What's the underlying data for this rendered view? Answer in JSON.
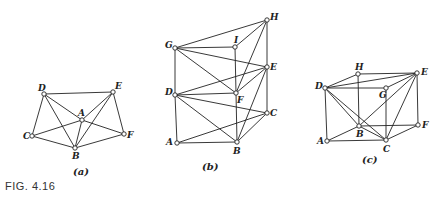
{
  "figure_label": "FIG. 4.16",
  "graphs": [
    {
      "caption": "(a)",
      "caption_pos": [
        73,
        175
      ],
      "nodes": {
        "D": {
          "x": 44,
          "y": 94,
          "lx": -6,
          "ly": -3
        },
        "E": {
          "x": 113,
          "y": 92,
          "lx": 2,
          "ly": -3
        },
        "A": {
          "x": 82,
          "y": 120,
          "lx": -4,
          "ly": -4
        },
        "C": {
          "x": 32,
          "y": 136,
          "lx": -9,
          "ly": 3
        },
        "F": {
          "x": 124,
          "y": 134,
          "lx": 3,
          "ly": 4
        },
        "B": {
          "x": 75,
          "y": 148,
          "lx": -3,
          "ly": 11
        }
      },
      "edges": [
        [
          "D",
          "E"
        ],
        [
          "D",
          "C"
        ],
        [
          "D",
          "A"
        ],
        [
          "A",
          "F"
        ],
        [
          "D",
          "B"
        ],
        [
          "E",
          "A"
        ],
        [
          "C",
          "A"
        ],
        [
          "E",
          "B"
        ],
        [
          "E",
          "F"
        ],
        [
          "A",
          "B"
        ],
        [
          "C",
          "B"
        ],
        [
          "B",
          "F"
        ]
      ]
    },
    {
      "caption": "(b)",
      "caption_pos": [
        202,
        170
      ],
      "nodes": {
        "H": {
          "x": 267,
          "y": 20,
          "lx": 3,
          "ly": 0
        },
        "I": {
          "x": 235,
          "y": 47,
          "lx": -1,
          "ly": -4
        },
        "G": {
          "x": 175,
          "y": 48,
          "lx": -10,
          "ly": 0
        },
        "E": {
          "x": 267,
          "y": 67,
          "lx": 3,
          "ly": 3
        },
        "D": {
          "x": 175,
          "y": 95,
          "lx": -10,
          "ly": 0
        },
        "F": {
          "x": 236,
          "y": 93,
          "lx": 1,
          "ly": 10
        },
        "C": {
          "x": 267,
          "y": 113,
          "lx": 3,
          "ly": 3
        },
        "A": {
          "x": 177,
          "y": 143,
          "lx": -11,
          "ly": 2
        },
        "B": {
          "x": 237,
          "y": 142,
          "lx": -4,
          "ly": 12
        }
      },
      "edges": [
        [
          "G",
          "H"
        ],
        [
          "G",
          "I"
        ],
        [
          "G",
          "E"
        ],
        [
          "G",
          "F"
        ],
        [
          "G",
          "D"
        ],
        [
          "I",
          "F"
        ],
        [
          "I",
          "H"
        ],
        [
          "H",
          "E"
        ],
        [
          "H",
          "F"
        ],
        [
          "E",
          "D"
        ],
        [
          "E",
          "F"
        ],
        [
          "E",
          "B"
        ],
        [
          "E",
          "C"
        ],
        [
          "D",
          "F"
        ],
        [
          "D",
          "C"
        ],
        [
          "D",
          "B"
        ],
        [
          "D",
          "A"
        ],
        [
          "F",
          "B"
        ],
        [
          "A",
          "B"
        ],
        [
          "A",
          "C"
        ],
        [
          "C",
          "B"
        ]
      ]
    },
    {
      "caption": "(c)",
      "caption_pos": [
        362,
        163
      ],
      "nodes": {
        "H": {
          "x": 358,
          "y": 74,
          "lx": -3,
          "ly": -4
        },
        "E": {
          "x": 417,
          "y": 73,
          "lx": 4,
          "ly": 2
        },
        "D": {
          "x": 325,
          "y": 88,
          "lx": -10,
          "ly": 1
        },
        "G": {
          "x": 386,
          "y": 88,
          "lx": -7,
          "ly": 10
        },
        "B": {
          "x": 359,
          "y": 126,
          "lx": -3,
          "ly": 11
        },
        "F": {
          "x": 418,
          "y": 125,
          "lx": 4,
          "ly": 3
        },
        "A": {
          "x": 327,
          "y": 141,
          "lx": -10,
          "ly": 3
        },
        "C": {
          "x": 386,
          "y": 140,
          "lx": -3,
          "ly": 12
        }
      },
      "edges": [
        [
          "D",
          "H"
        ],
        [
          "H",
          "E"
        ],
        [
          "D",
          "E"
        ],
        [
          "D",
          "G"
        ],
        [
          "G",
          "E"
        ],
        [
          "D",
          "A"
        ],
        [
          "D",
          "B"
        ],
        [
          "D",
          "C"
        ],
        [
          "H",
          "B"
        ],
        [
          "G",
          "C"
        ],
        [
          "E",
          "F"
        ],
        [
          "E",
          "C"
        ],
        [
          "E",
          "B"
        ],
        [
          "B",
          "F"
        ],
        [
          "A",
          "B"
        ],
        [
          "A",
          "C"
        ],
        [
          "B",
          "C"
        ],
        [
          "C",
          "F"
        ]
      ]
    }
  ]
}
